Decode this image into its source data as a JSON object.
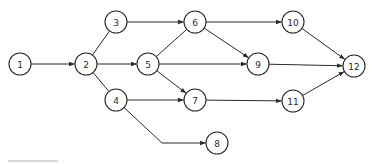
{
  "diagram": {
    "type": "directed-network",
    "colors": {
      "stroke": "#2a2a2a",
      "fill": "#ffffff"
    },
    "nodes": [
      {
        "id": "1",
        "label": "1",
        "x": 20,
        "y": 64
      },
      {
        "id": "2",
        "label": "2",
        "x": 86,
        "y": 64
      },
      {
        "id": "3",
        "label": "3",
        "x": 116,
        "y": 22
      },
      {
        "id": "4",
        "label": "4",
        "x": 116,
        "y": 100
      },
      {
        "id": "5",
        "label": "5",
        "x": 148,
        "y": 64
      },
      {
        "id": "6",
        "label": "6",
        "x": 195,
        "y": 22
      },
      {
        "id": "7",
        "label": "7",
        "x": 195,
        "y": 100
      },
      {
        "id": "8",
        "label": "8",
        "x": 217,
        "y": 143
      },
      {
        "id": "9",
        "label": "9",
        "x": 258,
        "y": 64
      },
      {
        "id": "10",
        "label": "10",
        "x": 293,
        "y": 22
      },
      {
        "id": "11",
        "label": "11",
        "x": 293,
        "y": 101
      },
      {
        "id": "12",
        "label": "12",
        "x": 354,
        "y": 66
      }
    ],
    "edges": [
      {
        "from": "1",
        "to": "2",
        "arrow": true
      },
      {
        "from": "2",
        "to": "3",
        "arrow": false
      },
      {
        "from": "2",
        "to": "5",
        "arrow": true
      },
      {
        "from": "2",
        "to": "4",
        "arrow": false
      },
      {
        "from": "3",
        "to": "6",
        "arrow": true
      },
      {
        "from": "5",
        "to": "6",
        "arrow": false
      },
      {
        "from": "5",
        "to": "9",
        "arrow": true
      },
      {
        "from": "5",
        "to": "7",
        "arrow": true
      },
      {
        "from": "4",
        "to": "7",
        "arrow": true
      },
      {
        "from": "4",
        "to": "8",
        "arrow": true,
        "bend": [
          162,
          143
        ]
      },
      {
        "from": "6",
        "to": "10",
        "arrow": true
      },
      {
        "from": "6",
        "to": "9",
        "arrow": true
      },
      {
        "from": "10",
        "to": "12",
        "arrow": true
      },
      {
        "from": "9",
        "to": "12",
        "arrow": true
      },
      {
        "from": "7",
        "to": "11",
        "arrow": true
      },
      {
        "from": "11",
        "to": "12",
        "arrow": true
      }
    ],
    "node_radius": 11
  }
}
